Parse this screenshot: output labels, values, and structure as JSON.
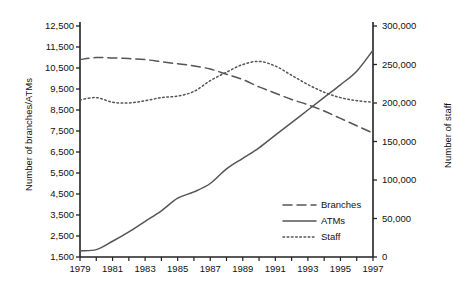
{
  "chart_data": {
    "type": "line",
    "title": "",
    "xlabel": "",
    "ylabel": "Number of branches/ATMs",
    "ylabel_right": "Number of staff",
    "x": [
      1979,
      1980,
      1981,
      1982,
      1983,
      1984,
      1985,
      1986,
      1987,
      1988,
      1989,
      1990,
      1991,
      1992,
      1993,
      1994,
      1995,
      1996,
      1997
    ],
    "xlim": [
      1979,
      1997
    ],
    "ylim": [
      1500,
      12500
    ],
    "ylim_right": [
      0,
      300000
    ],
    "xticks": [
      "1979",
      "1981",
      "1983",
      "1985",
      "1987",
      "1989",
      "1991",
      "1993",
      "1995",
      "1997"
    ],
    "yticks_left": [
      "1,500",
      "2,500",
      "3,500",
      "4,500",
      "5,500",
      "6,500",
      "7,500",
      "8,500",
      "9,500",
      "10,500",
      "11,500",
      "12,500"
    ],
    "yticks_right": [
      "0",
      "50,000",
      "100,000",
      "150,000",
      "200,000",
      "250,000",
      "300,000"
    ],
    "grid": false,
    "legend_position": "bottom-right",
    "series": [
      {
        "name": "Branches",
        "axis": "left",
        "style": "dashed",
        "color": "#555555",
        "values": [
          10900,
          11000,
          10980,
          10950,
          10900,
          10800,
          10700,
          10600,
          10450,
          10200,
          9950,
          9600,
          9300,
          9000,
          8750,
          8450,
          8100,
          7750,
          7400
        ]
      },
      {
        "name": "ATMs",
        "axis": "left",
        "style": "solid",
        "color": "#555555",
        "values": [
          1800,
          1850,
          2250,
          2700,
          3200,
          3700,
          4300,
          4600,
          5000,
          5700,
          6200,
          6700,
          7300,
          7900,
          8500,
          9100,
          9700,
          10350,
          11350
        ]
      },
      {
        "name": "Staff",
        "axis": "right",
        "style": "dotted",
        "color": "#555555",
        "values": [
          204000,
          207000,
          201000,
          200000,
          203000,
          207000,
          209000,
          215000,
          229000,
          240000,
          250000,
          254000,
          248000,
          236000,
          224000,
          214000,
          207000,
          203000,
          201000
        ]
      }
    ]
  },
  "legend": {
    "items": [
      {
        "label": "Branches",
        "style": "dashed"
      },
      {
        "label": "ATMs",
        "style": "solid"
      },
      {
        "label": "Staff",
        "style": "dotted"
      }
    ]
  }
}
